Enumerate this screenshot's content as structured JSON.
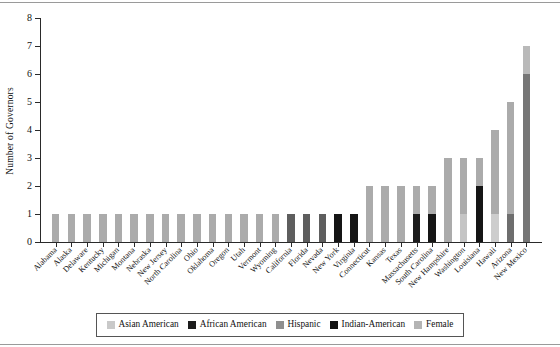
{
  "chart_data": {
    "type": "bar",
    "stacked": true,
    "title": "",
    "xlabel": "",
    "ylabel": "Number of Governors",
    "ylim": [
      0,
      8
    ],
    "ytick_labels": [
      "0",
      "1",
      "2",
      "3",
      "4",
      "5",
      "6",
      "7",
      "8"
    ],
    "grid": false,
    "legend_position": "bottom",
    "series": [
      {
        "name": "Asian American",
        "color": "#c9c9c9"
      },
      {
        "name": "African American",
        "color": "#1c1c1c"
      },
      {
        "name": "Hispanic",
        "color": "#8f8f8f"
      },
      {
        "name": "Indian-American",
        "color": "#121212"
      },
      {
        "name": "Female",
        "color": "#b4b4b4"
      }
    ],
    "categories": [
      "Alabama",
      "Alaska",
      "Delaware",
      "Kentucky",
      "Michigan",
      "Montana",
      "Nebraska",
      "New Jersey",
      "North Carolina",
      "Ohio",
      "Oklahoma",
      "Oregon",
      "Utah",
      "Vermont",
      "Wyoming",
      "California",
      "Florida",
      "Nevada",
      "New York",
      "Virginia",
      "Connecticut",
      "Kansas",
      "Texas",
      "Massachusetts",
      "South Carolina",
      "New Hampshire",
      "Washington",
      "Louisiana",
      "Hawaii",
      "Arizona",
      "New Mexico"
    ],
    "totals": [
      1,
      1,
      1,
      1,
      1,
      1,
      1,
      1,
      1,
      1,
      1,
      1,
      1,
      1,
      1,
      1,
      1,
      1,
      1,
      1,
      2,
      2,
      2,
      2,
      2,
      3,
      3,
      3,
      4,
      5,
      7
    ],
    "bars": [
      {
        "category": "Alabama",
        "total": 1,
        "segments": [
          {
            "series": "Female",
            "value": 1,
            "color": "#ababab"
          }
        ]
      },
      {
        "category": "Alaska",
        "total": 1,
        "segments": [
          {
            "series": "Female",
            "value": 1,
            "color": "#ababab"
          }
        ]
      },
      {
        "category": "Delaware",
        "total": 1,
        "segments": [
          {
            "series": "Female",
            "value": 1,
            "color": "#ababab"
          }
        ]
      },
      {
        "category": "Kentucky",
        "total": 1,
        "segments": [
          {
            "series": "Female",
            "value": 1,
            "color": "#ababab"
          }
        ]
      },
      {
        "category": "Michigan",
        "total": 1,
        "segments": [
          {
            "series": "Female",
            "value": 1,
            "color": "#ababab"
          }
        ]
      },
      {
        "category": "Montana",
        "total": 1,
        "segments": [
          {
            "series": "Female",
            "value": 1,
            "color": "#ababab"
          }
        ]
      },
      {
        "category": "Nebraska",
        "total": 1,
        "segments": [
          {
            "series": "Female",
            "value": 1,
            "color": "#ababab"
          }
        ]
      },
      {
        "category": "New Jersey",
        "total": 1,
        "segments": [
          {
            "series": "Female",
            "value": 1,
            "color": "#ababab"
          }
        ]
      },
      {
        "category": "North Carolina",
        "total": 1,
        "segments": [
          {
            "series": "Female",
            "value": 1,
            "color": "#ababab"
          }
        ]
      },
      {
        "category": "Ohio",
        "total": 1,
        "segments": [
          {
            "series": "Female",
            "value": 1,
            "color": "#ababab"
          }
        ]
      },
      {
        "category": "Oklahoma",
        "total": 1,
        "segments": [
          {
            "series": "Female",
            "value": 1,
            "color": "#ababab"
          }
        ]
      },
      {
        "category": "Oregon",
        "total": 1,
        "segments": [
          {
            "series": "Female",
            "value": 1,
            "color": "#ababab"
          }
        ]
      },
      {
        "category": "Utah",
        "total": 1,
        "segments": [
          {
            "series": "Female",
            "value": 1,
            "color": "#ababab"
          }
        ]
      },
      {
        "category": "Vermont",
        "total": 1,
        "segments": [
          {
            "series": "Female",
            "value": 1,
            "color": "#ababab"
          }
        ]
      },
      {
        "category": "Wyoming",
        "total": 1,
        "segments": [
          {
            "series": "Female",
            "value": 1,
            "color": "#ababab"
          }
        ]
      },
      {
        "category": "California",
        "total": 1,
        "segments": [
          {
            "series": "Hispanic",
            "value": 1,
            "color": "#5e5e5e"
          }
        ]
      },
      {
        "category": "Florida",
        "total": 1,
        "segments": [
          {
            "series": "Hispanic",
            "value": 1,
            "color": "#5e5e5e"
          }
        ]
      },
      {
        "category": "Nevada",
        "total": 1,
        "segments": [
          {
            "series": "Hispanic",
            "value": 1,
            "color": "#5e5e5e"
          }
        ]
      },
      {
        "category": "New York",
        "total": 1,
        "segments": [
          {
            "series": "Indian-American",
            "value": 1,
            "color": "#151515"
          }
        ]
      },
      {
        "category": "Virginia",
        "total": 1,
        "segments": [
          {
            "series": "Indian-American",
            "value": 1,
            "color": "#151515"
          }
        ]
      },
      {
        "category": "Connecticut",
        "total": 2,
        "segments": [
          {
            "series": "Female",
            "value": 2,
            "color": "#ababab"
          }
        ]
      },
      {
        "category": "Kansas",
        "total": 2,
        "segments": [
          {
            "series": "Female",
            "value": 2,
            "color": "#ababab"
          }
        ]
      },
      {
        "category": "Texas",
        "total": 2,
        "segments": [
          {
            "series": "Female",
            "value": 2,
            "color": "#ababab"
          }
        ]
      },
      {
        "category": "Massachusetts",
        "total": 2,
        "segments": [
          {
            "series": "African American",
            "value": 1,
            "color": "#1c1c1c"
          },
          {
            "series": "Female",
            "value": 1,
            "color": "#ababab"
          }
        ]
      },
      {
        "category": "South Carolina",
        "total": 2,
        "segments": [
          {
            "series": "Indian-American",
            "value": 1,
            "color": "#151515"
          },
          {
            "series": "Female",
            "value": 1,
            "color": "#ababab"
          }
        ]
      },
      {
        "category": "New Hampshire",
        "total": 3,
        "segments": [
          {
            "series": "Female",
            "value": 3,
            "color": "#ababab"
          }
        ]
      },
      {
        "category": "Washington",
        "total": 3,
        "segments": [
          {
            "series": "Asian American",
            "value": 1,
            "color": "#c4c4c4"
          },
          {
            "series": "Female",
            "value": 2,
            "color": "#ababab"
          }
        ]
      },
      {
        "category": "Louisiana",
        "total": 3,
        "segments": [
          {
            "series": "Indian-American",
            "value": 2,
            "color": "#151515"
          },
          {
            "series": "Female",
            "value": 1,
            "color": "#ababab"
          }
        ]
      },
      {
        "category": "Hawaii",
        "total": 4,
        "segments": [
          {
            "series": "Asian American",
            "value": 1,
            "color": "#cdcdcd"
          },
          {
            "series": "Female",
            "value": 3,
            "color": "#ababab"
          }
        ]
      },
      {
        "category": "Arizona",
        "total": 5,
        "segments": [
          {
            "series": "Hispanic",
            "value": 1,
            "color": "#6e6e6e"
          },
          {
            "series": "Female",
            "value": 4,
            "color": "#ababab"
          }
        ]
      },
      {
        "category": "New Mexico",
        "total": 7,
        "segments": [
          {
            "series": "Hispanic",
            "value": 6,
            "color": "#767676"
          },
          {
            "series": "Female",
            "value": 1,
            "color": "#b9b9b9"
          }
        ]
      }
    ]
  },
  "legend": {
    "items": [
      {
        "label": "Asian American",
        "color": "#c9c9c9"
      },
      {
        "label": "African American",
        "color": "#1c1c1c"
      },
      {
        "label": "Hispanic",
        "color": "#8f8f8f"
      },
      {
        "label": "Indian-American",
        "color": "#121212"
      },
      {
        "label": "Female",
        "color": "#b4b4b4"
      }
    ]
  }
}
